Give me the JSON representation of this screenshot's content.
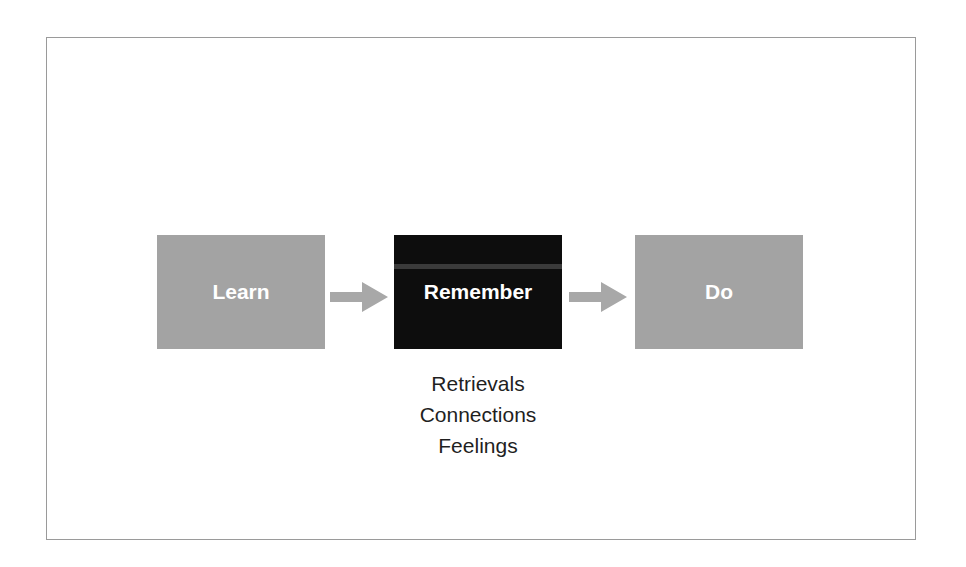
{
  "diagram": {
    "nodes": [
      {
        "id": "learn",
        "label": "Learn",
        "fill": "#a3a3a3"
      },
      {
        "id": "remember",
        "label": "Remember",
        "fill": "#0d0d0d"
      },
      {
        "id": "do",
        "label": "Do",
        "fill": "#a3a3a3"
      }
    ],
    "edges": [
      {
        "from": "learn",
        "to": "remember"
      },
      {
        "from": "remember",
        "to": "do"
      }
    ],
    "remember_details": [
      "Retrievals",
      "Connections",
      "Feelings"
    ],
    "arrow_color": "#a8a8a8"
  }
}
